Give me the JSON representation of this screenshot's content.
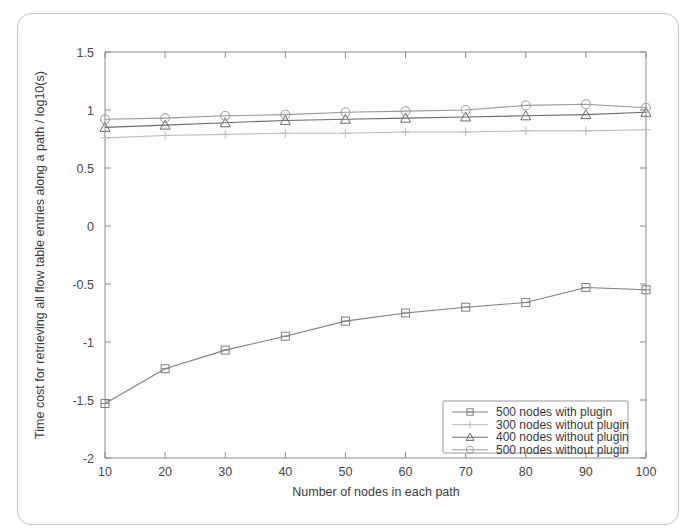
{
  "figure": {
    "kind": "scanned-figure",
    "background_color": "#fdfdfd",
    "border_color": "#c9c9c9"
  },
  "chart_data": {
    "type": "line",
    "title": "",
    "subtitle": "",
    "xlabel": "Number of nodes in each path",
    "ylabel": "Time cost for retrieving all flow table entries along a path / log10(s)",
    "x": [
      10,
      20,
      30,
      40,
      50,
      60,
      70,
      80,
      90,
      100
    ],
    "xlim": [
      10,
      100
    ],
    "ylim": [
      -2,
      1.5
    ],
    "xticks": [
      10,
      20,
      30,
      40,
      50,
      60,
      70,
      80,
      90,
      100
    ],
    "yticks": [
      -2,
      -1.5,
      -1,
      -0.5,
      0,
      0.5,
      1,
      1.5
    ],
    "xtick_labels": [
      "10",
      "20",
      "30",
      "40",
      "50",
      "60",
      "70",
      "80",
      "90",
      "100"
    ],
    "ytick_labels": [
      "-2",
      "-1.5",
      "-1",
      "-0.5",
      "0",
      "0.5",
      "1",
      "1.5"
    ],
    "grid": false,
    "legend_position": "lower right",
    "series": [
      {
        "name": "500 nodes with plugin",
        "marker": "square",
        "color": "#808080",
        "values": [
          -1.53,
          -1.23,
          -1.07,
          -0.95,
          -0.82,
          -0.75,
          -0.7,
          -0.66,
          -0.53,
          -0.55
        ]
      },
      {
        "name": "300 nodes without plugin",
        "marker": "plus",
        "color": "#bdbdbd",
        "values": [
          0.76,
          0.78,
          0.79,
          0.8,
          0.8,
          0.81,
          0.81,
          0.82,
          0.82,
          0.83
        ]
      },
      {
        "name": "400 nodes without plugin",
        "marker": "triangle",
        "color": "#6e6e6e",
        "values": [
          0.85,
          0.87,
          0.89,
          0.91,
          0.92,
          0.93,
          0.94,
          0.95,
          0.96,
          0.98
        ]
      },
      {
        "name": "500 nodes without plugin",
        "marker": "circle",
        "color": "#9a9a9a",
        "values": [
          0.92,
          0.93,
          0.95,
          0.96,
          0.98,
          0.99,
          1.0,
          1.04,
          1.05,
          1.02
        ]
      }
    ]
  },
  "legend": {
    "entries": [
      {
        "label": "500 nodes with plugin",
        "marker": "square"
      },
      {
        "label": "300 nodes without plugin",
        "marker": "plus"
      },
      {
        "label": "400 nodes without plugin",
        "marker": "triangle"
      },
      {
        "label": "500 nodes without plugin",
        "marker": "circle"
      }
    ]
  }
}
